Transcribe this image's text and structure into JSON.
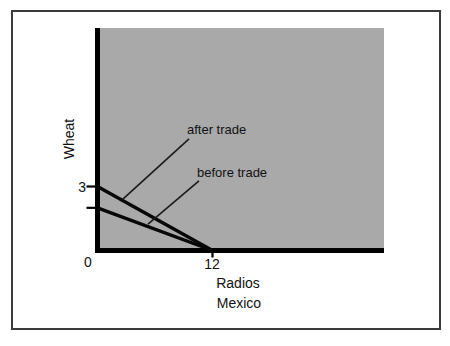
{
  "colors": {
    "page_bg": "#ffffff",
    "frame_border": "#3b3b3b",
    "plot_bg": "#a9a9a9",
    "axis": "#000000",
    "line": "#070707",
    "leader": "#1a1a1a",
    "text": "#111111"
  },
  "chart_data": {
    "type": "line",
    "title": "",
    "ylabel": "Wheat",
    "xlabel": "Radios",
    "caption": "Mexico",
    "xlim": [
      0,
      30
    ],
    "ylim": [
      0,
      10.4
    ],
    "grid": false,
    "legend": "none (lines labeled by in-plot annotations)",
    "x_ticks": [
      {
        "value": 0,
        "label": "0"
      },
      {
        "value": 12,
        "label": "12"
      }
    ],
    "y_ticks": [
      {
        "value": 3,
        "label": "3"
      },
      {
        "value": 2,
        "label": ""
      }
    ],
    "series": [
      {
        "name": "after trade",
        "x": [
          0,
          12
        ],
        "y": [
          3,
          0
        ]
      },
      {
        "name": "before trade",
        "x": [
          0,
          12
        ],
        "y": [
          2,
          0
        ]
      }
    ],
    "annotations": [
      {
        "text": "after trade",
        "line_from": [
          9.55,
          5.23
        ],
        "line_to": [
          2.56,
          2.37
        ]
      },
      {
        "text": "before trade",
        "line_from": [
          10.59,
          3.26
        ],
        "line_to": [
          5.27,
          1.24
        ]
      }
    ]
  }
}
